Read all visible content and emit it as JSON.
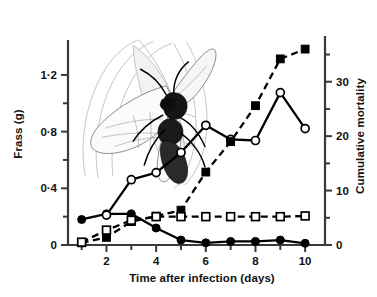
{
  "chart_data": {
    "type": "line",
    "title": "",
    "xlabel": "Time after infection (days)",
    "ylabel": "Frass (g)",
    "ylabel_right": "Cumulative mortality",
    "xlim": [
      0.45,
      10.8
    ],
    "ylim": [
      0,
      1.39
    ],
    "ylim_right": [
      0,
      36.2
    ],
    "x": [
      1,
      2,
      3,
      4,
      5,
      6,
      7,
      8,
      9,
      10
    ],
    "xticks": [
      1,
      2,
      3,
      4,
      5,
      6,
      7,
      8,
      9,
      10
    ],
    "xticklabels": [
      "",
      "2",
      "",
      "4",
      "",
      "6",
      "",
      "8",
      "",
      "10"
    ],
    "yticks_left": [
      0,
      0.2,
      0.4,
      0.6,
      0.8,
      1.0,
      1.2
    ],
    "yticklabels_left": [
      "0",
      "",
      "0·4",
      "",
      "0·8",
      "",
      "1·2"
    ],
    "yticks_right": [
      0,
      5,
      10,
      15,
      20,
      25,
      30,
      35
    ],
    "yticklabels_right": [
      "0",
      "",
      "10",
      "",
      "20",
      "",
      "30",
      ""
    ],
    "grid": false,
    "legend": "none",
    "series": [
      {
        "name": "Frass (filled circles, solid line)",
        "axis": "left",
        "marker": "filled-circle",
        "linestyle": "solid",
        "color": "#000000",
        "x": [
          1,
          2,
          3,
          4,
          5,
          6,
          7,
          8,
          9,
          10
        ],
        "values": [
          0.18,
          0.22,
          0.22,
          0.12,
          0.035,
          0.015,
          0.025,
          0.025,
          0.035,
          0.012
        ]
      },
      {
        "name": "Cumulative mortality (open circles, solid line)",
        "axis": "right",
        "marker": "open-circle",
        "linestyle": "solid",
        "color": "#000000",
        "x": [
          2,
          3,
          4,
          5,
          6,
          7,
          8,
          9,
          10
        ],
        "values": [
          5.5,
          12.0,
          13.3,
          17.0,
          22.0,
          19.4,
          19.2,
          28.0,
          21.4
        ]
      },
      {
        "name": "Cumulative mortality (filled squares, dashed line)",
        "axis": "right",
        "marker": "filled-square",
        "linestyle": "dashed",
        "color": "#000000",
        "x": [
          1,
          2,
          3,
          4,
          5,
          6,
          7,
          8,
          9,
          10
        ],
        "values": [
          0.4,
          1.4,
          4.3,
          5.3,
          6.4,
          13.4,
          19.0,
          25.6,
          34.2,
          36.0
        ]
      },
      {
        "name": "Frass control (open squares, dashed line)",
        "axis": "left",
        "marker": "open-square",
        "linestyle": "dashed",
        "color": "#000000",
        "x": [
          1,
          2,
          3,
          4,
          5,
          6,
          7,
          8,
          9,
          10
        ],
        "values": [
          0.02,
          0.105,
          0.175,
          0.2,
          0.2,
          0.2,
          0.2,
          0.2,
          0.2,
          0.205
        ]
      }
    ],
    "inset_image": {
      "name": "parasitoid-wasp-on-host-drawing",
      "description": "Line drawing of a winged parasitoid wasp resting on a host larva"
    }
  }
}
